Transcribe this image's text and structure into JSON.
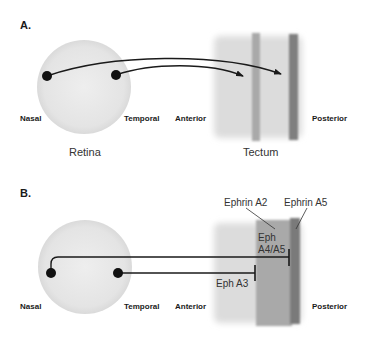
{
  "panels": {
    "a": {
      "label": "A.",
      "nasal": "Nasal",
      "temporal": "Temporal",
      "anterior": "Anterior",
      "posterior": "Posterior",
      "retina": "Retina",
      "tectum": "Tectum"
    },
    "b": {
      "label": "B.",
      "nasal": "Nasal",
      "temporal": "Temporal",
      "anterior": "Anterior",
      "posterior": "Posterior",
      "ephrin_a2": "Ephrin A2",
      "ephrin_a5": "Ephrin A5",
      "eph_a4a5_line1": "Eph",
      "eph_a4a5_line2": "A4/A5",
      "eph_a3": "Eph A3"
    }
  },
  "colors": {
    "retina_fill": "#e6e6e6",
    "tectum_light": "#dcdcdc",
    "tectum_mid": "#a9a9a9",
    "tectum_dark": "#7a7a7a",
    "axon": "#1a1a1a"
  }
}
